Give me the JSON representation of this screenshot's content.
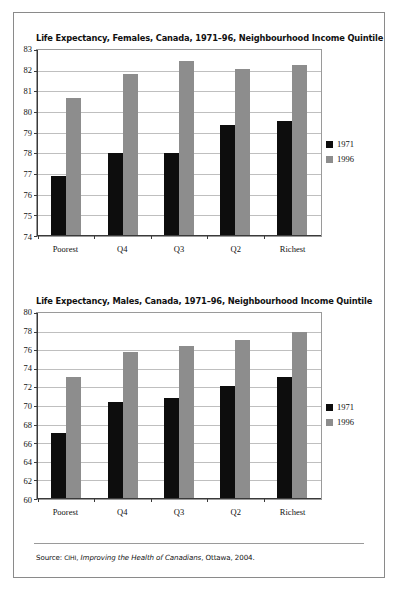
{
  "document": {
    "source_note": {
      "prefix": "Source:",
      "organization": "CIHI",
      "publication": "Improving the Health of Canadians",
      "place_year": ", Ottawa, 2004."
    }
  },
  "legend": {
    "series": [
      {
        "label": "1971",
        "color": "#0d0d0d"
      },
      {
        "label": "1996",
        "color": "#8d8d8d"
      }
    ]
  },
  "chart_data": [
    {
      "type": "bar",
      "title": "Life Expectancy, Females, Canada, 1971–96, Neighbourhood Income Quintile",
      "xlabel": "",
      "ylabel": "",
      "ylim": [
        74,
        83
      ],
      "ytick_step": 1,
      "yticks": [
        83,
        82,
        81,
        80,
        79,
        78,
        77,
        76,
        75,
        74
      ],
      "grid": true,
      "legend_position": "right",
      "categories": [
        "Poorest",
        "Q4",
        "Q3",
        "Q2",
        "Richest"
      ],
      "series": [
        {
          "name": "1971",
          "color": "#0d0d0d",
          "values": [
            76.9,
            78.0,
            78.0,
            79.4,
            79.6
          ]
        },
        {
          "name": "1996",
          "color": "#8d8d8d",
          "values": [
            80.7,
            81.9,
            82.5,
            82.1,
            82.3
          ]
        }
      ]
    },
    {
      "type": "bar",
      "title": "Life Expectancy, Males, Canada, 1971–96, Neighbourhood Income Quintile",
      "xlabel": "",
      "ylabel": "",
      "ylim": [
        60,
        80
      ],
      "ytick_step": 2,
      "yticks": [
        80,
        78,
        76,
        74,
        72,
        70,
        68,
        66,
        64,
        62,
        60
      ],
      "grid": true,
      "legend_position": "right",
      "categories": [
        "Poorest",
        "Q4",
        "Q3",
        "Q2",
        "Richest"
      ],
      "series": [
        {
          "name": "1971",
          "color": "#0d0d0d",
          "values": [
            67.1,
            70.4,
            70.9,
            72.2,
            73.2
          ]
        },
        {
          "name": "1996",
          "color": "#8d8d8d",
          "values": [
            73.2,
            75.9,
            76.5,
            77.2,
            78.0
          ]
        }
      ]
    }
  ]
}
